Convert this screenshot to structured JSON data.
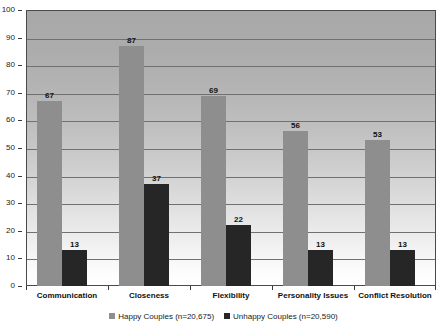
{
  "chart_data": {
    "type": "bar",
    "title": "",
    "xlabel": "",
    "ylabel": "",
    "ylim": [
      0,
      100
    ],
    "ytick_step": 10,
    "yticks": [
      "0",
      "10",
      "20",
      "30",
      "40",
      "50",
      "60",
      "70",
      "80",
      "90",
      "100"
    ],
    "grid": true,
    "legend_position": "bottom",
    "categories": [
      "Communication",
      "Closeness",
      "Flexibility",
      "Personality Issues",
      "Conflict Resolution"
    ],
    "series": [
      {
        "name": "Happy Couples (n=20,675)",
        "color": "#8e8e8e",
        "values": [
          67,
          87,
          69,
          56,
          53
        ],
        "labels": [
          "67",
          "87",
          "69",
          "56",
          "53"
        ]
      },
      {
        "name": "Unhappy Couples (n=20,590)",
        "color": "#262626",
        "values": [
          13,
          37,
          22,
          13,
          13
        ],
        "labels": [
          "13",
          "37",
          "22",
          "13",
          "13"
        ]
      }
    ]
  },
  "legend": {
    "entries": [
      {
        "label": "Happy Couples (n=20,675)",
        "swatch": "happy"
      },
      {
        "label": "Unhappy Couples (n=20,590)",
        "swatch": "unhappy"
      }
    ]
  }
}
